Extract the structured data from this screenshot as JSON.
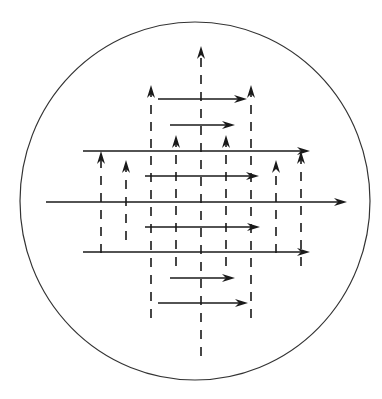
{
  "diagram": {
    "colors": {
      "stroke": "#1a1a1a",
      "circle": "#333333",
      "background": "#ffffff"
    },
    "circle": {
      "cx": 195,
      "cy": 201,
      "rx": 175,
      "ry": 179
    },
    "vertical_arrows": [
      {
        "x": 101,
        "y_top": 151,
        "y_bottom": 253
      },
      {
        "x": 126,
        "y_top": 160,
        "y_bottom": 240
      },
      {
        "x": 151,
        "y_top": 85,
        "y_bottom": 318
      },
      {
        "x": 176,
        "y_top": 135,
        "y_bottom": 266
      },
      {
        "x": 201,
        "y_top": 46,
        "y_bottom": 356
      },
      {
        "x": 226,
        "y_top": 135,
        "y_bottom": 266
      },
      {
        "x": 251,
        "y_top": 85,
        "y_bottom": 318
      },
      {
        "x": 276,
        "y_top": 160,
        "y_bottom": 253
      },
      {
        "x": 301,
        "y_top": 151,
        "y_bottom": 266
      }
    ],
    "horizontal_arrows": [
      {
        "y": 99,
        "x_start": 158,
        "x_end": 247
      },
      {
        "y": 125,
        "x_start": 170,
        "x_end": 235
      },
      {
        "y": 151,
        "x_start": 83,
        "x_end": 310
      },
      {
        "y": 176,
        "x_start": 145,
        "x_end": 259
      },
      {
        "y": 202,
        "x_start": 46,
        "x_end": 347
      },
      {
        "y": 227,
        "x_start": 145,
        "x_end": 260
      },
      {
        "y": 252,
        "x_start": 83,
        "x_end": 310
      },
      {
        "y": 278,
        "x_start": 170,
        "x_end": 235
      },
      {
        "y": 303,
        "x_start": 158,
        "x_end": 248
      }
    ]
  }
}
